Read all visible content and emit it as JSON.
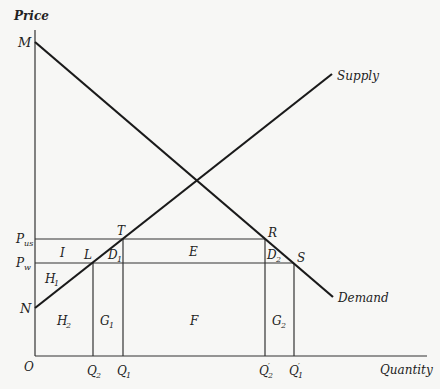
{
  "diagram": {
    "axes": {
      "y_label": "Price",
      "x_label": "Quantity",
      "origin_label": "O"
    },
    "curves": {
      "supply_label": "Supply",
      "demand_label": "Demand"
    },
    "price_labels": {
      "p_us": "P",
      "p_us_sub": "us",
      "p_w": "P",
      "p_w_sub": "w"
    },
    "points": {
      "M": "M",
      "N": "N",
      "T": "T",
      "L": "L",
      "R": "R",
      "S": "S"
    },
    "quantity_labels": {
      "q2": "Q",
      "q2_sub": "2",
      "q1": "Q",
      "q1_sub": "1",
      "q2p": "Q",
      "q2p_sub": "2",
      "q1p": "Q",
      "q1p_sub": "1",
      "prime": "′"
    },
    "areas": {
      "I": "I",
      "H1": "H",
      "H1_sub": "1",
      "H2": "H",
      "H2_sub": "2",
      "D1": "D",
      "D1_sub": "1",
      "D2": "D",
      "D2_sub": "2",
      "E": "E",
      "F": "F",
      "G1": "G",
      "G1_sub": "1",
      "G2": "G",
      "G2_sub": "2"
    }
  }
}
